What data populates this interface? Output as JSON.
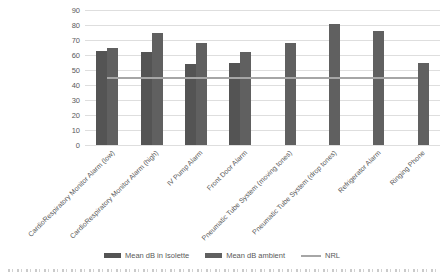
{
  "chart_data": {
    "type": "bar",
    "title": "",
    "categories": [
      "CardioRespiratory Monitor Alarm (low)",
      "CardioRespiratory Monitor Alarm (high)",
      "IV Pump Alarm",
      "Front Door Alarm",
      "Pneumatic Tube System (moving tones)",
      "Pneumatic Tube System (drop tones)",
      "Refrigerator Alarm",
      "Ringing Phone"
    ],
    "series": [
      {
        "name": "Mean dB in Isolette",
        "color": "#545454",
        "values": [
          63,
          62,
          54,
          55,
          null,
          null,
          null,
          null
        ]
      },
      {
        "name": "Mean dB ambient",
        "color": "#606060",
        "values": [
          65,
          75,
          68,
          62,
          68,
          81,
          76,
          55
        ]
      }
    ],
    "reference_line": {
      "name": "NRL",
      "value": 45,
      "color": "#a6a6a6"
    },
    "ylim": [
      0,
      90
    ],
    "ytick_step": 10,
    "yticks": [
      "0",
      "10",
      "20",
      "30",
      "40",
      "50",
      "60",
      "70",
      "80",
      "90"
    ],
    "grid": true,
    "legend_position": "bottom",
    "xlabel": "",
    "ylabel": ""
  }
}
